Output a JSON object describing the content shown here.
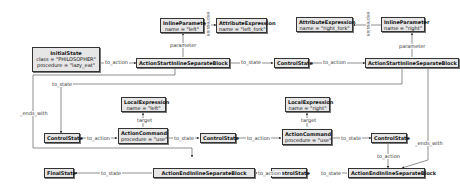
{
  "nodes": {
    "initial_state": {
      "title": "InitialState",
      "attrs": [
        "class = \"PHILOSOPHER\"",
        "procedure = \"lazy_eat\""
      ]
    },
    "inline_param_left": {
      "title": "InlineParameter",
      "attrs": [
        "name = \"left\""
      ]
    },
    "attr_expr_left": {
      "title": "AttributeExpression",
      "attrs": [
        "name = \"left_fork\""
      ]
    },
    "attr_expr_right": {
      "title": "AttributeExpression",
      "attrs": [
        "name = \"right_fork\""
      ]
    },
    "inline_param_right": {
      "title": "InlineParameter",
      "attrs": [
        "name = \"right\""
      ]
    },
    "asisb_left": {
      "title": "ActionStartInlineSeparateBlock"
    },
    "control_state_top": {
      "title": "ControlState"
    },
    "asisb_right": {
      "title": "ActionStartInlineSeparateBlock"
    },
    "local_expr_left": {
      "title": "LocalExpression",
      "attrs": [
        "name = \"left\""
      ]
    },
    "local_expr_right": {
      "title": "LocalExpression",
      "attrs": [
        "name = \"right\""
      ]
    },
    "control_state_1": {
      "title": "ControlState"
    },
    "action_cmd_left": {
      "title": "ActionCommand",
      "attrs": [
        "procedure = \"use\""
      ]
    },
    "control_state_2": {
      "title": "ControlState"
    },
    "action_cmd_right": {
      "title": "ActionCommand",
      "attrs": [
        "procedure = \"use\""
      ]
    },
    "control_state_3": {
      "title": "ControlState"
    },
    "final_state": {
      "title": "FinalState"
    },
    "aeisb_left": {
      "title": "ActionEndInlineSeparateBlock"
    },
    "control_state_bottom": {
      "title": "ControlState"
    },
    "aeisb_right": {
      "title": "ActionEndInlineSeparateBlock"
    }
  },
  "edge_labels": {
    "to_action": "to_action",
    "to_state": "to_state",
    "parameter": "parameter",
    "expression": "expression",
    "target": "target",
    "ends_with": "_ends_with"
  }
}
